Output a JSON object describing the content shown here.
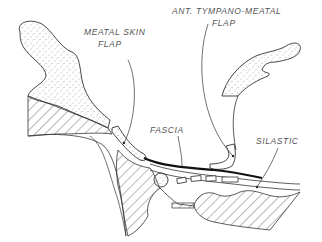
{
  "diagram": {
    "labels": {
      "meatal_skin_flap_line1": "MEATAL SKIN",
      "meatal_skin_flap_line2": "FLAP",
      "ant_tympano_meatal_flap_line1": "ANT. TYMPANO-MEATAL",
      "ant_tympano_meatal_flap_line2": "FLAP",
      "fascia": "FASCIA",
      "silastic": "SILASTIC"
    },
    "colors": {
      "ink": "#2a2a2a",
      "label": "#555555",
      "background": "#ffffff"
    }
  }
}
